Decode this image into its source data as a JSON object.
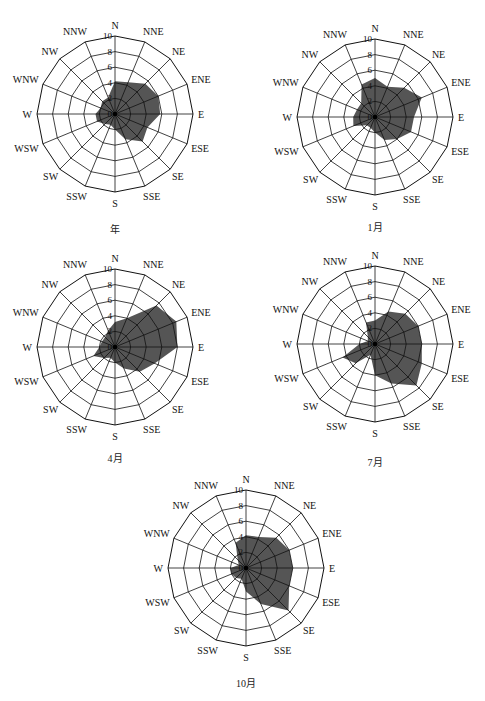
{
  "directions": [
    "N",
    "NNE",
    "NE",
    "ENE",
    "E",
    "ESE",
    "SE",
    "SSE",
    "S",
    "SSW",
    "SW",
    "WSW",
    "W",
    "WNW",
    "NW",
    "NNW"
  ],
  "radial_ticks": [
    "0",
    "2",
    "4",
    "6",
    "8",
    "10"
  ],
  "colors": {
    "fill": "#555555",
    "grid": "#111111",
    "background": "#ffffff"
  },
  "chart_data": [
    {
      "type": "radar",
      "title": "年",
      "categories": [
        "N",
        "NNE",
        "NE",
        "ENE",
        "E",
        "ESE",
        "SE",
        "SSE",
        "S",
        "SSW",
        "SW",
        "WSW",
        "W",
        "WNW",
        "NW",
        "NNW"
      ],
      "values": [
        4.2,
        4.4,
        5.5,
        6.0,
        5.8,
        4.5,
        5.0,
        3.5,
        2.0,
        1.5,
        1.8,
        2.5,
        2.5,
        2.0,
        2.3,
        2.3
      ],
      "rlim": [
        0,
        10
      ],
      "rticks": [
        0,
        2,
        4,
        6,
        8,
        10
      ],
      "grid": true
    },
    {
      "type": "radar",
      "title": "1月",
      "categories": [
        "N",
        "NNE",
        "NE",
        "ENE",
        "E",
        "ESE",
        "SE",
        "SSE",
        "S",
        "SSW",
        "SW",
        "WSW",
        "W",
        "WNW",
        "NW",
        "NNW"
      ],
      "values": [
        5.0,
        4.2,
        5.3,
        6.5,
        5.0,
        5.0,
        4.0,
        3.2,
        2.0,
        1.5,
        1.5,
        3.0,
        2.8,
        2.5,
        2.5,
        4.5
      ],
      "rlim": [
        0,
        10
      ],
      "rticks": [
        0,
        2,
        4,
        6,
        8,
        10
      ],
      "grid": true
    },
    {
      "type": "radar",
      "title": "4月",
      "categories": [
        "N",
        "NNE",
        "NE",
        "ENE",
        "E",
        "ESE",
        "SE",
        "SSE",
        "S",
        "SSW",
        "SW",
        "WSW",
        "W",
        "WNW",
        "NW",
        "NNW"
      ],
      "values": [
        3.2,
        4.0,
        7.5,
        8.5,
        8.0,
        5.5,
        4.5,
        3.0,
        2.0,
        1.5,
        2.0,
        3.0,
        2.0,
        1.8,
        1.8,
        2.3
      ],
      "rlim": [
        0,
        10
      ],
      "rticks": [
        0,
        2,
        4,
        6,
        8,
        10
      ],
      "grid": true
    },
    {
      "type": "radar",
      "title": "7月",
      "categories": [
        "N",
        "NNE",
        "NE",
        "ENE",
        "E",
        "ESE",
        "SE",
        "SSE",
        "S",
        "SSW",
        "SW",
        "WSW",
        "W",
        "WNW",
        "NW",
        "NNW"
      ],
      "values": [
        3.0,
        4.5,
        5.5,
        6.0,
        6.0,
        6.5,
        7.5,
        5.5,
        4.0,
        1.5,
        3.5,
        4.5,
        2.0,
        1.0,
        1.3,
        3.0
      ],
      "rlim": [
        0,
        10
      ],
      "rticks": [
        0,
        2,
        4,
        6,
        8,
        10
      ],
      "grid": true
    },
    {
      "type": "radar",
      "title": "10月",
      "categories": [
        "N",
        "NNE",
        "NE",
        "ENE",
        "E",
        "ESE",
        "SE",
        "SSE",
        "S",
        "SSW",
        "SW",
        "WSW",
        "W",
        "WNW",
        "NW",
        "NNW"
      ],
      "values": [
        4.2,
        4.3,
        5.5,
        6.0,
        6.0,
        6.0,
        7.7,
        5.0,
        3.0,
        1.5,
        1.8,
        2.0,
        2.0,
        1.0,
        1.5,
        3.5
      ],
      "rlim": [
        0,
        10
      ],
      "rticks": [
        0,
        2,
        4,
        6,
        8,
        10
      ],
      "grid": true
    }
  ],
  "captions": [
    "年",
    "1月",
    "4月",
    "7月",
    "10月"
  ]
}
